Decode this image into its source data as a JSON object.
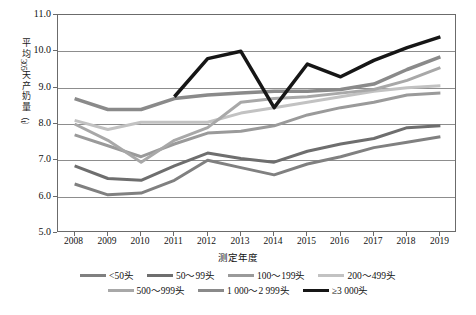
{
  "chart_data": {
    "type": "line",
    "title": "",
    "xlabel": "测定年度",
    "ylabel": "平均305天产奶量（t）",
    "categories": [
      "2008",
      "2009",
      "2010",
      "2011",
      "2012",
      "2013",
      "2014",
      "2015",
      "2016",
      "2017",
      "2018",
      "2019"
    ],
    "ylim": [
      5.0,
      11.0
    ],
    "ytick_labels": [
      "11.0",
      "10.0",
      "9.0",
      "8.0",
      "7.0",
      "6.0",
      "5.0"
    ],
    "ytick_values": [
      11.0,
      10.0,
      9.0,
      8.0,
      7.0,
      6.0,
      5.0
    ],
    "grid": true,
    "legend_position": "bottom",
    "series": [
      {
        "name": "<50头",
        "color": "#808080",
        "width": 3,
        "values": [
          6.35,
          6.05,
          6.1,
          6.45,
          7.0,
          6.8,
          6.6,
          6.9,
          7.1,
          7.35,
          7.5,
          7.65
        ]
      },
      {
        "name": "50～99头",
        "color": "#6e6e6e",
        "width": 3,
        "values": [
          6.85,
          6.5,
          6.45,
          6.85,
          7.2,
          7.05,
          6.95,
          7.25,
          7.45,
          7.6,
          7.9,
          7.95
        ]
      },
      {
        "name": "100～199头",
        "color": "#9a9a9a",
        "width": 3,
        "values": [
          7.7,
          7.4,
          7.1,
          7.45,
          7.75,
          7.8,
          7.95,
          8.25,
          8.45,
          8.6,
          8.8,
          8.85
        ]
      },
      {
        "name": "200～499头",
        "color": "#c2c2c2",
        "width": 3,
        "values": [
          8.1,
          7.85,
          8.05,
          8.05,
          8.05,
          8.3,
          8.45,
          8.6,
          8.75,
          8.9,
          9.0,
          9.05
        ]
      },
      {
        "name": "500～999头",
        "color": "#a8a8a8",
        "width": 3,
        "values": [
          8.0,
          7.55,
          6.95,
          7.55,
          7.9,
          8.6,
          8.7,
          8.75,
          8.85,
          8.95,
          9.2,
          9.55
        ]
      },
      {
        "name": "1 000～2 999头",
        "color": "#8a8a8a",
        "width": 3.5,
        "values": [
          8.7,
          8.4,
          8.4,
          8.7,
          8.8,
          8.85,
          8.9,
          8.9,
          8.95,
          9.1,
          9.5,
          9.85
        ]
      },
      {
        "name": "≥3 000头",
        "color": "#161616",
        "width": 3.5,
        "values": [
          null,
          null,
          null,
          8.75,
          9.8,
          10.0,
          8.45,
          9.65,
          9.3,
          9.75,
          10.1,
          10.4
        ]
      }
    ]
  },
  "legend": {
    "row1": [
      "<50头",
      "50～99头",
      "100～199头",
      "200～499头"
    ],
    "row2": [
      "500～999头",
      "1 000～2 999头",
      "≥3 000头"
    ]
  },
  "axes": {
    "y_title_chars": [
      "平",
      "均"
    ],
    "y_title_num": "305",
    "y_title_chars2": [
      "天",
      "产",
      "奶",
      "量"
    ],
    "y_title_unit": "（t）",
    "x_title": "测定年度"
  }
}
